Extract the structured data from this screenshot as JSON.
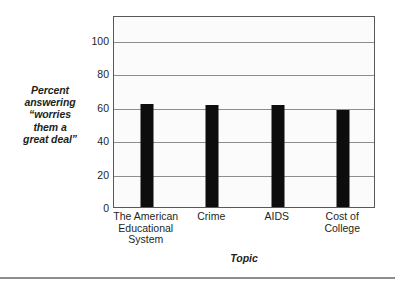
{
  "chart_data": {
    "type": "bar",
    "title": "",
    "subtitle": "",
    "xlabel": "Topic",
    "ylabel": "Percent answering \"worries them a great deal\"",
    "ylabel_lines": [
      "Percent",
      "answering",
      "“worries",
      "them a",
      "great deal”"
    ],
    "categories": [
      "The American Educational System",
      "Crime",
      "AIDS",
      "Cost of College"
    ],
    "category_lines": [
      [
        "The American",
        "Educational",
        "System"
      ],
      [
        "Crime"
      ],
      [
        "AIDS"
      ],
      [
        "Cost of",
        "College"
      ]
    ],
    "values": [
      62,
      61,
      61,
      58
    ],
    "ylim": [
      0,
      115
    ],
    "yticks": [
      0,
      20,
      40,
      60,
      80,
      100
    ],
    "ytick_labels": [
      "0",
      "20",
      "40",
      "60",
      "80",
      "100"
    ],
    "gridlines": [
      20,
      40,
      60,
      80,
      100
    ],
    "grid": true,
    "legend": null,
    "legend_position": "none",
    "bar_color": "#0d0d0d",
    "plot_background": "#fbfbfb",
    "grid_color": "#8d8d8f",
    "frame_color": "#58585a",
    "text_color": "#231f20"
  }
}
